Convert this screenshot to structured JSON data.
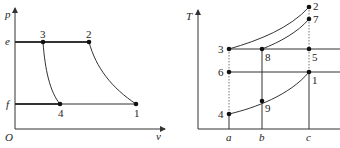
{
  "pv_diagram": {
    "axis_y_label": "p",
    "axis_x_label": "v",
    "origin_label": "O",
    "level_labels": {
      "upper": "e",
      "lower": "f"
    },
    "points": [
      {
        "id": "3",
        "label": "3",
        "x": 43,
        "y": 42
      },
      {
        "id": "2",
        "label": "2",
        "x": 89,
        "y": 42
      },
      {
        "id": "4",
        "label": "4",
        "x": 60,
        "y": 104
      },
      {
        "id": "1",
        "label": "1",
        "x": 136,
        "y": 104
      }
    ]
  },
  "ts_diagram": {
    "axis_y_label": "T",
    "x_tick_labels": [
      "a",
      "b",
      "c"
    ],
    "points": [
      {
        "id": "2",
        "label": "2",
        "x": 309,
        "y": 7
      },
      {
        "id": "7",
        "label": "7",
        "x": 309,
        "y": 19
      },
      {
        "id": "3",
        "label": "3",
        "x": 229,
        "y": 49
      },
      {
        "id": "8",
        "label": "8",
        "x": 262,
        "y": 49
      },
      {
        "id": "5",
        "label": "5",
        "x": 309,
        "y": 49
      },
      {
        "id": "6",
        "label": "6",
        "x": 229,
        "y": 72
      },
      {
        "id": "1",
        "label": "1",
        "x": 309,
        "y": 72
      },
      {
        "id": "9",
        "label": "9",
        "x": 262,
        "y": 101
      },
      {
        "id": "4",
        "label": "4",
        "x": 229,
        "y": 114
      }
    ]
  },
  "colors": {
    "line": "#333333",
    "dotted": "#777777",
    "point": "#111111"
  }
}
